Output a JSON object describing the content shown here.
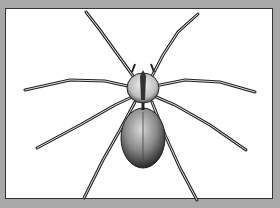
{
  "image": {
    "subject": "spider illustration",
    "style": "black-and-white engraving",
    "colors": {
      "frame": "#a8a8a8",
      "panel": "#ffffff",
      "border": "#333333",
      "ink": "#1a1a1a"
    }
  }
}
